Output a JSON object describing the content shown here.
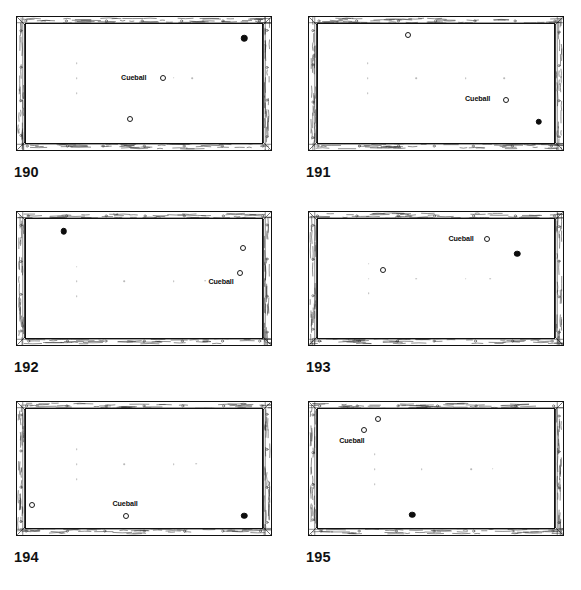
{
  "figure": {
    "layout": {
      "columns": 2,
      "rows": 3
    },
    "cue_label_text": "Cueball",
    "colors": {
      "ink": "#111111",
      "cloth": "#ffffff",
      "spot": "#b9b9b9",
      "object_ball": "#0d0d0d"
    }
  },
  "panels": [
    {
      "number": "190",
      "cue_label": "Cueball",
      "cue_label_align": "right",
      "cue_label_x": 51.0,
      "cue_label_y": 45.0,
      "balls": [
        {
          "kind": "hollow",
          "role": "cueball",
          "x": 58.0,
          "y": 45.0
        },
        {
          "kind": "hollow",
          "role": "object",
          "x": 44.0,
          "y": 80.0
        },
        {
          "kind": "solid",
          "role": "object",
          "x": 92.5,
          "y": 12.0
        }
      ],
      "spots": [
        {
          "x": 21.5,
          "y": 33.0
        },
        {
          "x": 21.5,
          "y": 45.5
        },
        {
          "x": 21.5,
          "y": 58.0
        },
        {
          "x": 41.5,
          "y": 45.0
        },
        {
          "x": 62.5,
          "y": 45.0
        },
        {
          "x": 70.5,
          "y": 45.5
        }
      ]
    },
    {
      "number": "191",
      "cue_label": "Cueball",
      "cue_label_align": "right",
      "cue_label_x": 73.0,
      "cue_label_y": 63.0,
      "balls": [
        {
          "kind": "hollow",
          "role": "cueball",
          "x": 79.5,
          "y": 63.5
        },
        {
          "kind": "hollow",
          "role": "object",
          "x": 38.0,
          "y": 9.0
        },
        {
          "kind": "solid",
          "role": "object",
          "x": 93.5,
          "y": 82.0
        }
      ],
      "spots": [
        {
          "x": 21.0,
          "y": 33.0
        },
        {
          "x": 21.0,
          "y": 45.5
        },
        {
          "x": 21.0,
          "y": 58.0
        },
        {
          "x": 41.5,
          "y": 45.5
        },
        {
          "x": 62.5,
          "y": 45.5
        },
        {
          "x": 79.0,
          "y": 45.5
        }
      ]
    },
    {
      "number": "192",
      "cue_label": "Cueball",
      "cue_label_align": "right",
      "cue_label_x": 88.0,
      "cue_label_y": 53.0,
      "balls": [
        {
          "kind": "hollow",
          "role": "cueball",
          "x": 90.5,
          "y": 45.5
        },
        {
          "kind": "hollow",
          "role": "object",
          "x": 92.0,
          "y": 24.5
        },
        {
          "kind": "solid",
          "role": "object",
          "x": 16.0,
          "y": 10.5
        }
      ],
      "spots": [
        {
          "x": 21.5,
          "y": 40.0
        },
        {
          "x": 21.5,
          "y": 52.5
        },
        {
          "x": 21.5,
          "y": 65.0
        },
        {
          "x": 41.5,
          "y": 52.5
        },
        {
          "x": 62.5,
          "y": 52.5
        },
        {
          "x": 76.0,
          "y": 52.0
        }
      ]
    },
    {
      "number": "193",
      "cue_label": "Cueball",
      "cue_label_align": "right",
      "cue_label_x": 66.0,
      "cue_label_y": 17.0,
      "balls": [
        {
          "kind": "hollow",
          "role": "cueball",
          "x": 71.5,
          "y": 17.0
        },
        {
          "kind": "hollow",
          "role": "object",
          "x": 27.5,
          "y": 42.5
        },
        {
          "kind": "solid",
          "role": "object",
          "x": 84.5,
          "y": 29.0
        }
      ],
      "spots": [
        {
          "x": 21.5,
          "y": 37.5
        },
        {
          "x": 21.5,
          "y": 50.0
        },
        {
          "x": 21.5,
          "y": 62.5
        },
        {
          "x": 41.5,
          "y": 50.0
        },
        {
          "x": 62.5,
          "y": 50.0
        },
        {
          "x": 73.0,
          "y": 50.0
        }
      ]
    },
    {
      "number": "194",
      "cue_label": "Cueball",
      "cue_label_align": "center",
      "cue_label_x": 42.0,
      "cue_label_y": 80.0,
      "balls": [
        {
          "kind": "hollow",
          "role": "cueball",
          "x": 42.5,
          "y": 90.0
        },
        {
          "kind": "hollow",
          "role": "object",
          "x": 2.5,
          "y": 80.5
        },
        {
          "kind": "solid",
          "role": "object",
          "x": 92.5,
          "y": 89.5
        }
      ],
      "spots": [
        {
          "x": 21.5,
          "y": 34.0
        },
        {
          "x": 21.5,
          "y": 46.5
        },
        {
          "x": 21.5,
          "y": 59.0
        },
        {
          "x": 41.5,
          "y": 46.5
        },
        {
          "x": 62.5,
          "y": 46.5
        },
        {
          "x": 72.0,
          "y": 46.0
        }
      ]
    },
    {
      "number": "195",
      "cue_label": "Cueball",
      "cue_label_align": "left",
      "cue_label_x": 9.0,
      "cue_label_y": 27.0,
      "balls": [
        {
          "kind": "hollow",
          "role": "cueball",
          "x": 19.5,
          "y": 17.5
        },
        {
          "kind": "hollow",
          "role": "object",
          "x": 25.5,
          "y": 8.0
        },
        {
          "kind": "solid",
          "role": "object",
          "x": 40.0,
          "y": 89.0
        }
      ],
      "spots": [
        {
          "x": 24.0,
          "y": 38.0
        },
        {
          "x": 24.0,
          "y": 50.5
        },
        {
          "x": 24.0,
          "y": 63.0
        },
        {
          "x": 44.0,
          "y": 50.5
        },
        {
          "x": 65.0,
          "y": 50.5
        },
        {
          "x": 74.0,
          "y": 50.0
        }
      ]
    }
  ]
}
